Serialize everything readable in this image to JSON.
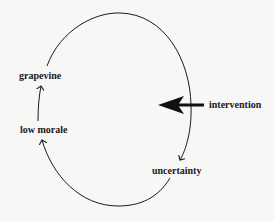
{
  "diagram": {
    "type": "feedback-loop",
    "nodes": {
      "grapevine": {
        "label": "grapevine"
      },
      "low_morale": {
        "label": "low morale"
      },
      "uncertainty": {
        "label": "uncertainty"
      },
      "intervention": {
        "label": "intervention"
      }
    },
    "edges": [
      {
        "from": "uncertainty",
        "to": "low morale",
        "style": "curved-arrow"
      },
      {
        "from": "low morale",
        "to": "grapevine",
        "style": "straight-arrow"
      },
      {
        "from": "grapevine",
        "to": "uncertainty",
        "style": "curved-arrow"
      },
      {
        "from": "intervention",
        "to": "loop",
        "style": "bold-arrow"
      }
    ],
    "colors": {
      "background": "#f7f7f5",
      "line": "#1a1a1a"
    }
  }
}
